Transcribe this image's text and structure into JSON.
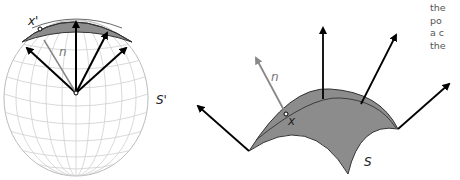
{
  "figure": {
    "left_panel": {
      "sphere_label": "S'",
      "point_label": "x'",
      "normal_label": "n"
    },
    "right_panel": {
      "surface_label": "S",
      "point_label": "x",
      "normal_label": "n"
    },
    "side_text": {
      "lines": [
        "the",
        "po",
        "a c",
        "the"
      ]
    },
    "colors": {
      "patch_fill": "#8c8c8c",
      "arrow": "#000000",
      "normal_arrow": "#888888",
      "grid": "#c8c8c8"
    }
  }
}
